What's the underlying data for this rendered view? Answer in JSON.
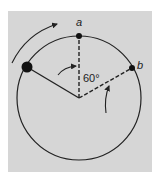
{
  "diagram": {
    "type": "rotation-circle",
    "background_color": "#d6d6d6",
    "stroke_color": "#222222",
    "circle": {
      "cx": 79,
      "cy": 98,
      "r": 62
    },
    "points": {
      "a": {
        "label": "a",
        "x": 79,
        "y": 36
      },
      "b": {
        "label": "b",
        "x": 132,
        "y": 68
      },
      "mass": {
        "x": 27,
        "y": 67
      }
    },
    "angle_label": "60°",
    "arrows": [
      "outer-rotation-arrow",
      "angle-arrow-left",
      "angle-arrow-right"
    ]
  }
}
